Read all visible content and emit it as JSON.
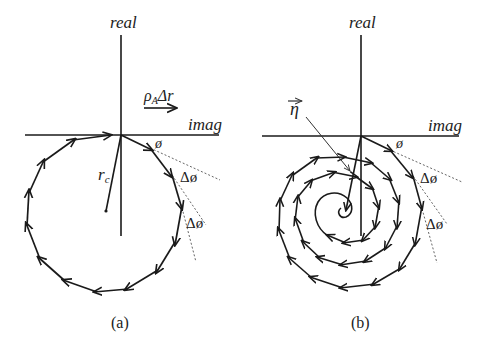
{
  "figure": {
    "panels": [
      {
        "id": "a",
        "caption": "(a)",
        "axis_labels": {
          "vertical": "real",
          "horizontal": "imag"
        },
        "step_vector_label": {
          "rho": "ρ",
          "sub": "A",
          "rest": "Δr"
        },
        "radius_label": {
          "main": "r",
          "sub": "c"
        },
        "angle_labels": {
          "phi": "ø",
          "delta_phi_1": "Δø",
          "delta_phi_2": "Δø"
        },
        "path_type": "circle",
        "description": "closed polygonal circle of step vectors rotating by constant Δø"
      },
      {
        "id": "b",
        "caption": "(b)",
        "axis_labels": {
          "vertical": "real",
          "horizontal": "imag"
        },
        "eta_label": "η",
        "angle_labels": {
          "phi": "ø",
          "delta_phi_1": "Δø",
          "delta_phi_2": "Δø"
        },
        "path_type": "spiral",
        "description": "inward polygonal spiral of step vectors converging toward η"
      }
    ],
    "colors": {
      "stroke": "#1a1a1a",
      "dotted": "#555555",
      "background": "#ffffff"
    }
  }
}
